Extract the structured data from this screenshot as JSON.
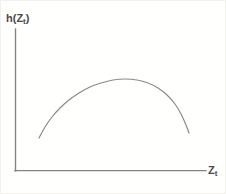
{
  "figure": {
    "background_color": "#fffffe",
    "border_color": "#f2f1ee",
    "width": 226,
    "height": 194
  },
  "axes": {
    "color": "#848484",
    "line_width": 1.4,
    "y_axis": {
      "x": 14,
      "y_top": 28,
      "y_bottom": 170
    },
    "x_axis": {
      "y": 170,
      "x_left": 14,
      "x_right": 205
    },
    "y_label_text": "h(Z",
    "y_label_sub": "t",
    "y_label_close": ")",
    "x_label_text": "Z",
    "x_label_sub": "t"
  },
  "chart_data": {
    "type": "line",
    "title": "",
    "xlabel": "Z_t",
    "ylabel": "h(Z_t)",
    "grid": false,
    "legend": null,
    "axis_style": "open (left and bottom spines only, no ticks, no tick labels)",
    "annotation": "Concave (inverted-U) hazard / response function h(Z_t): rises from a low value at small Z_t, reaches an interior maximum, then declines.",
    "curve_color": "#8a8a8a",
    "curve_width": 1.2,
    "xlim": [
      14,
      205
    ],
    "ylim": [
      170,
      28
    ],
    "pixel_points": [
      [
        38,
        137
      ],
      [
        44,
        126
      ],
      [
        51,
        116
      ],
      [
        59,
        107
      ],
      [
        68,
        99
      ],
      [
        78,
        92
      ],
      [
        89,
        86
      ],
      [
        100,
        82
      ],
      [
        112,
        79
      ],
      [
        124,
        78
      ],
      [
        136,
        79
      ],
      [
        147,
        82
      ],
      [
        157,
        87
      ],
      [
        166,
        94
      ],
      [
        174,
        103
      ],
      [
        180,
        113
      ],
      [
        185,
        124
      ],
      [
        188,
        132
      ]
    ],
    "x": [
      0.0,
      0.06,
      0.12,
      0.18,
      0.24,
      0.29,
      0.35,
      0.41,
      0.47,
      0.53,
      0.59,
      0.65,
      0.71,
      0.76,
      0.82,
      0.88,
      0.94,
      1.0
    ],
    "y": [
      0.23,
      0.31,
      0.38,
      0.45,
      0.51,
      0.56,
      0.6,
      0.63,
      0.65,
      0.65,
      0.64,
      0.62,
      0.59,
      0.54,
      0.47,
      0.4,
      0.32,
      0.27
    ]
  }
}
